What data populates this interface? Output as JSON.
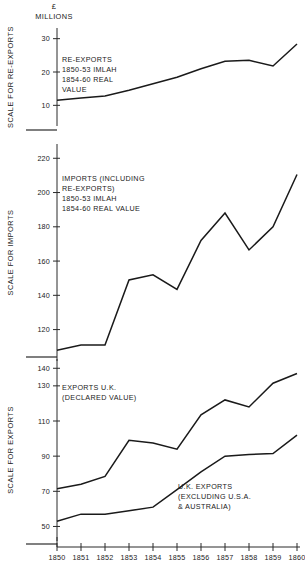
{
  "header": {
    "unit_line1": "£",
    "unit_line2": "MILLIONS"
  },
  "panels": {
    "reexports": {
      "axis_title": "SCALE FOR RE-EXPORTS",
      "ticks": [
        10,
        20,
        30
      ],
      "annotation": [
        "RE-EXPORTS",
        "1850-53 IMLAH",
        "1854-60 REAL",
        "VALUE"
      ]
    },
    "imports": {
      "axis_title": "SCALE FOR IMPORTS",
      "ticks": [
        120,
        140,
        160,
        180,
        200,
        220
      ],
      "annotation": [
        "IMPORTS (INCLUDING",
        "RE-EXPORTS)",
        "1850-53 IMLAH",
        "1854-60 REAL VALUE"
      ]
    },
    "exports": {
      "axis_title": "SCALE FOR EXPORTS",
      "ticks": [
        50,
        70,
        90,
        110,
        130,
        140
      ],
      "annotation_upper": [
        "EXPORTS U.K.",
        "(DECLARED VALUE)"
      ],
      "annotation_lower": [
        "U.K. EXPORTS",
        "(EXCLUDING U.S.A.",
        "& AUSTRALIA)"
      ]
    }
  },
  "chart_data": [
    {
      "type": "line",
      "title": "Re-exports",
      "xlabel": "",
      "ylabel": "SCALE FOR RE-EXPORTS",
      "unit": "£ millions",
      "x": [
        1850,
        1851,
        1852,
        1853,
        1854,
        1855,
        1856,
        1857,
        1858,
        1859,
        1860
      ],
      "categories": [
        "1850",
        "1851",
        "1852",
        "1853",
        "1854",
        "1855",
        "1856",
        "1857",
        "1858",
        "1859",
        "1860"
      ],
      "ylim": [
        5,
        32
      ],
      "yticks": [
        10,
        20,
        30
      ],
      "grid": false,
      "series": [
        {
          "name": "RE-EXPORTS 1850-53 IMLAH 1854-60 REAL VALUE",
          "values": [
            11.5,
            12.2,
            12.8,
            14.5,
            16.5,
            18.4,
            21.0,
            23.2,
            23.5,
            21.8,
            28.4
          ]
        }
      ]
    },
    {
      "type": "line",
      "title": "Imports (including re-exports)",
      "xlabel": "",
      "ylabel": "SCALE FOR IMPORTS",
      "unit": "£ millions",
      "x": [
        1850,
        1851,
        1852,
        1853,
        1854,
        1855,
        1856,
        1857,
        1858,
        1859,
        1860
      ],
      "categories": [
        "1850",
        "1851",
        "1852",
        "1853",
        "1854",
        "1855",
        "1856",
        "1857",
        "1858",
        "1859",
        "1860"
      ],
      "ylim": [
        104,
        226
      ],
      "yticks": [
        120,
        140,
        160,
        180,
        200,
        220
      ],
      "grid": false,
      "series": [
        {
          "name": "IMPORTS (INCLUDING RE-EXPORTS) 1850-53 IMLAH 1854-60 REAL VALUE",
          "values": [
            108.0,
            111.0,
            111.0,
            149.0,
            152.0,
            143.5,
            172.0,
            188.0,
            166.5,
            180.0,
            210.5
          ]
        }
      ]
    },
    {
      "type": "line",
      "title": "Exports U.K.",
      "xlabel": "",
      "ylabel": "SCALE FOR EXPORTS",
      "unit": "£ millions",
      "x": [
        1850,
        1851,
        1852,
        1853,
        1854,
        1855,
        1856,
        1857,
        1858,
        1859,
        1860
      ],
      "categories": [
        "1850",
        "1851",
        "1852",
        "1853",
        "1854",
        "1855",
        "1856",
        "1857",
        "1858",
        "1859",
        "1860"
      ],
      "ylim": [
        44,
        143
      ],
      "yticks": [
        50,
        70,
        90,
        110,
        130,
        140
      ],
      "grid": false,
      "series": [
        {
          "name": "EXPORTS U.K. (DECLARED VALUE)",
          "values": [
            71.5,
            74.0,
            78.5,
            99.0,
            97.5,
            94.0,
            113.5,
            122.0,
            118.0,
            131.5,
            137.0
          ]
        },
        {
          "name": "U.K. EXPORTS (EXCLUDING U.S.A. & AUSTRALIA)",
          "values": [
            53.0,
            57.0,
            57.0,
            59.0,
            61.0,
            71.0,
            81.0,
            90.0,
            91.0,
            91.5,
            102.0
          ]
        }
      ]
    }
  ]
}
